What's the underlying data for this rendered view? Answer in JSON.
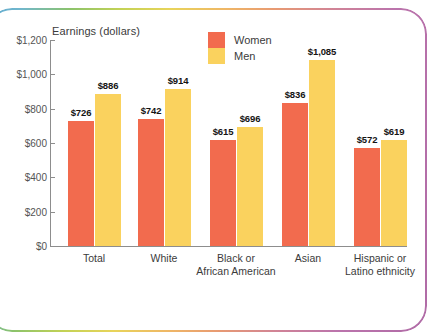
{
  "chart_data": {
    "type": "bar",
    "title": "Earnings (dollars)",
    "xlabel": "",
    "ylabel": "Earnings (dollars)",
    "ylim": [
      0,
      1200
    ],
    "grid": false,
    "legend_position": "inside-top-center",
    "categories": [
      "Total",
      "White",
      "Black or African American",
      "Asian",
      "Hispanic or Latino ethnicity"
    ],
    "category_lines": [
      [
        "Total"
      ],
      [
        "White"
      ],
      [
        "Black or",
        "African American"
      ],
      [
        "Asian"
      ],
      [
        "Hispanic or",
        "Latino ethnicity"
      ]
    ],
    "series": [
      {
        "name": "Women",
        "color": "#f26b4e",
        "values": [
          726,
          742,
          615,
          836,
          572
        ],
        "labels": [
          "$726",
          "$742",
          "$615",
          "$836",
          "$572"
        ]
      },
      {
        "name": "Men",
        "color": "#fad25e",
        "values": [
          886,
          914,
          696,
          1085,
          619
        ],
        "labels": [
          "$886",
          "$914",
          "$696",
          "$1,085",
          "$619"
        ]
      }
    ],
    "y_ticks": [
      0,
      200,
      400,
      600,
      800,
      1000,
      1200
    ],
    "y_tick_labels": [
      "$0",
      "$200",
      "$400",
      "$600",
      "$800",
      "$1,000",
      "$1,200"
    ]
  },
  "legend": {
    "items": [
      {
        "label": "Women",
        "color": "#f26b4e"
      },
      {
        "label": "Men",
        "color": "#fad25e"
      }
    ]
  },
  "frame": {
    "gradient_start": "#5fa8cf",
    "gradient_end": "#b06ba6"
  }
}
